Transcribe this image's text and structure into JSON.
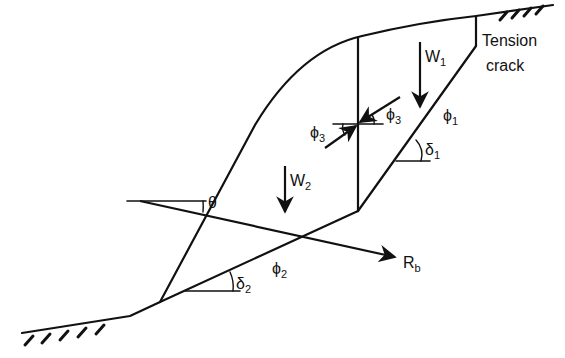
{
  "diagram": {
    "type": "slope stability free-body diagram (two-block wedge with tension crack)",
    "colors": {
      "line": "#111111",
      "background": "#ffffff"
    },
    "labels": {
      "tension_crack_line1": "Tension",
      "tension_crack_line2": "crack",
      "w1": {
        "main": "W",
        "sub": "1"
      },
      "w2": {
        "main": "W",
        "sub": "2"
      },
      "phi1": {
        "main": "ϕ",
        "sub": "1"
      },
      "phi2": {
        "main": "ϕ",
        "sub": "2"
      },
      "phi3_right": {
        "main": "ϕ",
        "sub": "3"
      },
      "phi3_left": {
        "main": "ϕ",
        "sub": "3"
      },
      "delta1": {
        "main": "δ",
        "sub": "1"
      },
      "delta2": {
        "main": "δ",
        "sub": "2"
      },
      "theta": "θ",
      "rb": {
        "main": "R",
        "sub": "b"
      }
    },
    "elements": [
      "upper ground surface (hatched)",
      "lower ground surface (hatched)",
      "slope face",
      "tension crack",
      "upper failure plane (dip delta1, friction phi1)",
      "lower failure plane (dip delta2, friction phi2)",
      "vertical inter-block boundary (friction phi3)",
      "weight vector W1",
      "weight vector W2",
      "bolt force Rb at angle theta"
    ]
  }
}
